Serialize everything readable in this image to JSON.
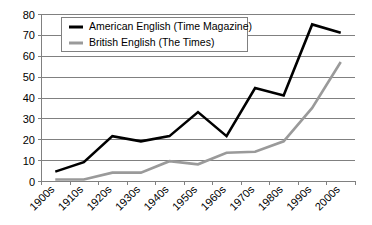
{
  "chart_data": {
    "type": "line",
    "title": "",
    "subtitle": "",
    "xlabel": "",
    "ylabel": "",
    "categories": [
      "1900s",
      "1910s",
      "1920s",
      "1930s",
      "1940s",
      "1950s",
      "1960s",
      "1970s",
      "1980s",
      "1990s",
      "2000s"
    ],
    "series": [
      {
        "name": "American English (Time Magazine)",
        "color": "#000000",
        "values": [
          4.5,
          9,
          21.5,
          19,
          21.5,
          33,
          21.5,
          44.5,
          41,
          75,
          71
        ]
      },
      {
        "name": "British English (The Times)",
        "color": "#9a9a9a",
        "values": [
          0.7,
          0.7,
          4,
          4,
          9.5,
          8,
          13.5,
          14,
          19,
          35,
          57
        ]
      }
    ],
    "ylim": [
      0,
      80
    ],
    "yticks": [
      0,
      10,
      20,
      30,
      40,
      50,
      60,
      70,
      80
    ],
    "ytick_labels": [
      "0",
      "10",
      "20",
      "30",
      "40",
      "50",
      "60",
      "70",
      "80"
    ],
    "grid": true,
    "grid_axis": "y",
    "legend_position": "top-left",
    "xtick_rotation": -45
  },
  "legend": {
    "entries": [
      {
        "label": "American English (Time Magazine)"
      },
      {
        "label": "British English (The Times)"
      }
    ]
  },
  "colors": {
    "american": "#000000",
    "british": "#9a9a9a",
    "grid": "#808080",
    "background": "#ffffff",
    "text": "#000000"
  }
}
